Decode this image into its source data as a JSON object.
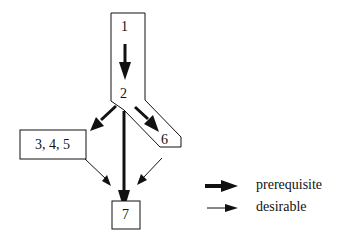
{
  "diagram": {
    "nodes": {
      "n1": "1",
      "n2": "2",
      "n345": "3, 4, 5",
      "n6": "6",
      "n7": "7"
    },
    "edges": [
      {
        "from": "1",
        "to": "2",
        "type": "prerequisite"
      },
      {
        "from": "2",
        "to": "3, 4, 5",
        "type": "prerequisite"
      },
      {
        "from": "2",
        "to": "6",
        "type": "prerequisite"
      },
      {
        "from": "2",
        "to": "7",
        "type": "prerequisite"
      },
      {
        "from": "3, 4, 5",
        "to": "7",
        "type": "desirable"
      },
      {
        "from": "6",
        "to": "7",
        "type": "desirable"
      }
    ],
    "legend": {
      "prerequisite": "prerequisite",
      "desirable": "desirable"
    },
    "colors": {
      "stroke": "#111111",
      "background": "#ffffff"
    }
  }
}
